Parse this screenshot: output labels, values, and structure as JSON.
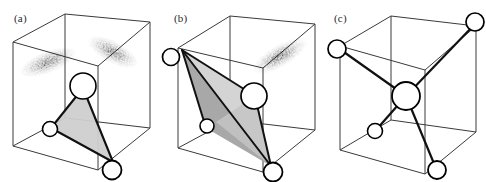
{
  "figure": {
    "background_color": "#ffffff",
    "width": 486,
    "height": 182,
    "panel_count": 3
  },
  "style": {
    "cube_edge_color": "#3a3a3a",
    "bond_color": "#111111",
    "atom_outline_color": "#000000",
    "atom_fill_color": "#ffffff",
    "face_light_fill": "#cfcfcf",
    "face_mid_fill": "#a8a8a8",
    "face_dark_fill": "#5e5e5e",
    "cloud_stipple_color": "#2b2b2b"
  },
  "panels": [
    {
      "id": "a",
      "label": "(a)",
      "has_cube": true,
      "has_electron_clouds": true,
      "electron_cloud_count": 2,
      "shaded_face_count": 1,
      "atoms": [
        {
          "name": "central-atom",
          "size": "large"
        },
        {
          "name": "left-atom",
          "size": "small"
        },
        {
          "name": "bottom-front-atom",
          "size": "medium"
        }
      ],
      "bond_count": 3
    },
    {
      "id": "b",
      "label": "(b)",
      "has_cube": true,
      "has_electron_clouds": true,
      "electron_cloud_count": 1,
      "shaded_face_count": 3,
      "atoms": [
        {
          "name": "left-corner-atom",
          "size": "medium"
        },
        {
          "name": "central-atom",
          "size": "large"
        },
        {
          "name": "lower-left-atom",
          "size": "small"
        },
        {
          "name": "bottom-front-atom",
          "size": "medium"
        }
      ],
      "bond_count": 3
    },
    {
      "id": "c",
      "label": "(c)",
      "has_cube": true,
      "has_electron_clouds": false,
      "electron_cloud_count": 0,
      "shaded_face_count": 0,
      "atoms": [
        {
          "name": "central-atom",
          "size": "large"
        },
        {
          "name": "top-right-atom",
          "size": "medium"
        },
        {
          "name": "left-atom",
          "size": "medium"
        },
        {
          "name": "lower-left-atom",
          "size": "small"
        },
        {
          "name": "bottom-atom",
          "size": "medium"
        }
      ],
      "bond_count": 4
    }
  ]
}
